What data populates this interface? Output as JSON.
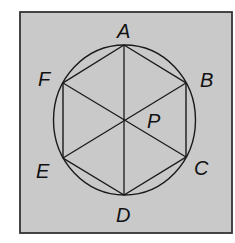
{
  "diagram": {
    "type": "geometry",
    "colors": {
      "background": "#ffffff",
      "frame_fill": "#c9c9c9",
      "frame_stroke": "#333333",
      "line": "#1a1a1a",
      "text": "#111111"
    },
    "vertices": [
      {
        "id": "A",
        "label": "A"
      },
      {
        "id": "B",
        "label": "B"
      },
      {
        "id": "C",
        "label": "C"
      },
      {
        "id": "D",
        "label": "D"
      },
      {
        "id": "E",
        "label": "E"
      },
      {
        "id": "F",
        "label": "F"
      }
    ],
    "center": {
      "id": "P",
      "label": "P"
    },
    "segments": [
      "AB",
      "BC",
      "CD",
      "DE",
      "EF",
      "FA",
      "AD",
      "BE",
      "CF"
    ],
    "shapes": [
      "circle",
      "hexagon",
      "square-frame"
    ]
  }
}
